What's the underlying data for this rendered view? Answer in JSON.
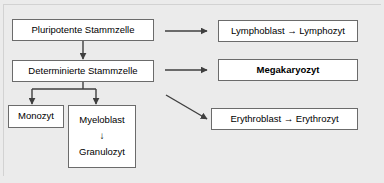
{
  "diagram": {
    "background_color": "#ebebeb",
    "node_fill": "#ffffff",
    "node_border_color": "#6b6b6b",
    "connector_color": "#3f3f3f",
    "nodes": [
      {
        "id": "pluripotente-stammzelle",
        "label": "Pluripotente Stammzelle",
        "bold": false
      },
      {
        "id": "determinierte-stammzelle",
        "label": "Determinierte Stammzelle",
        "bold": false
      },
      {
        "id": "monozyt",
        "label": "Monozyt",
        "bold": false
      },
      {
        "id": "myeloblast",
        "label": "Myeloblast",
        "arrow_glyph": "↓",
        "label2": "Granulozyt",
        "bold": false
      },
      {
        "id": "lymphoblast-lymphozyt",
        "label": "Lymphoblast → Lymphozyt",
        "bold": false
      },
      {
        "id": "megakaryozyt",
        "label": "Megakaryozyt",
        "bold": true
      },
      {
        "id": "erythroblast-erythrozyt",
        "label": "Erythroblast → Erythrozyt",
        "bold": false
      }
    ]
  }
}
